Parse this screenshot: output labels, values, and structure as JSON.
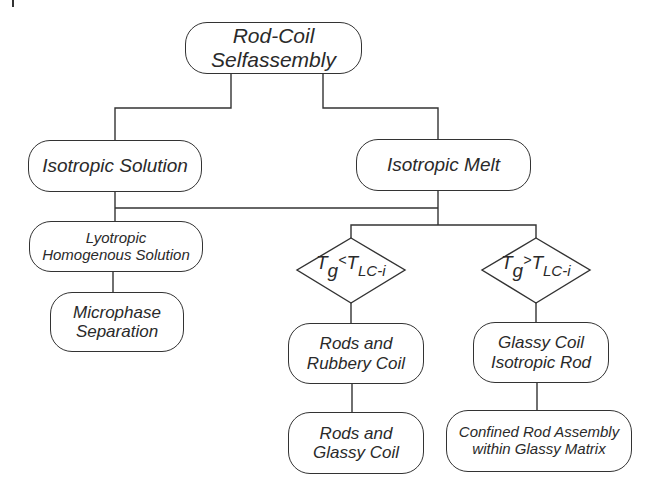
{
  "diagram": {
    "type": "flowchart",
    "colors": {
      "line": "#333333",
      "text": "#2a2a2a",
      "background": "#ffffff"
    },
    "nodes": {
      "root": {
        "line1": "Rod-Coil",
        "line2": "Selfassembly"
      },
      "isotropic_solution": {
        "label": "Isotropic Solution"
      },
      "isotropic_melt": {
        "label": "Isotropic Melt"
      },
      "lyotropic": {
        "line1": "Lyotropic",
        "line2": "Homogenous Solution"
      },
      "microphase": {
        "line1": "Microphase",
        "line2": "Separation"
      },
      "cond_less": {
        "T": "T",
        "sub_g": "g",
        "op": "<",
        "T2": "T",
        "sub_lc": "LC-i"
      },
      "cond_greater": {
        "T": "T",
        "sub_g": "g",
        "op": ">",
        "T2": "T",
        "sub_lc": "LC-i"
      },
      "rods_rubbery": {
        "line1": "Rods and",
        "line2": "Rubbery Coil"
      },
      "glassy_isotropic": {
        "line1": "Glassy Coil",
        "line2": "Isotropic Rod"
      },
      "rods_glassy": {
        "line1": "Rods and",
        "line2": "Glassy Coil"
      },
      "confined": {
        "line1": "Confined Rod Assembly",
        "line2": "within Glassy Matrix"
      }
    },
    "edges": [
      [
        "root",
        "isotropic_solution"
      ],
      [
        "root",
        "isotropic_melt"
      ],
      [
        "isotropic_solution",
        "lyotropic"
      ],
      [
        "isotropic_melt",
        "isotropic_solution"
      ],
      [
        "isotropic_melt",
        "cond_less"
      ],
      [
        "isotropic_melt",
        "cond_greater"
      ],
      [
        "lyotropic",
        "microphase"
      ],
      [
        "cond_less",
        "rods_rubbery"
      ],
      [
        "cond_greater",
        "glassy_isotropic"
      ],
      [
        "rods_rubbery",
        "rods_glassy"
      ],
      [
        "glassy_isotropic",
        "confined"
      ]
    ]
  }
}
